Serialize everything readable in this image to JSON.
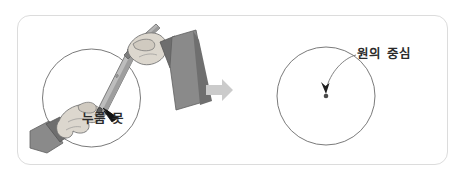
{
  "figure": {
    "panel": {
      "border_color": "#dcdcdc",
      "background_color": "#ffffff",
      "corner_radius": 13
    },
    "transition": {
      "icon": "right-arrow-icon",
      "color": "#c9c9c9",
      "direction": "right"
    }
  },
  "left_scene": {
    "name": "hands-drawing-circle",
    "circle": {
      "cx": 91.5,
      "cy": 98,
      "r": 49,
      "stroke_color": "#6b6b6b"
    },
    "label": {
      "text": "누름 못",
      "color": "#2b2b2b"
    },
    "pointer": {
      "icon": "arrow-pointer-icon",
      "color": "#1a1a1a",
      "points_to": "누름 못"
    },
    "objects": [
      {
        "name": "ruler-compass-bar",
        "fill": "#b3b3b3"
      },
      {
        "name": "pencil",
        "fill": "#a8a8a8"
      },
      {
        "name": "left-hand",
        "fill": "#d8d3cb"
      },
      {
        "name": "right-hand",
        "fill": "#d8d3cb"
      },
      {
        "name": "left-sleeve",
        "fill": "#7a7a7a"
      },
      {
        "name": "right-sleeve",
        "fill": "#7a7a7a"
      },
      {
        "name": "push-pin",
        "fill": "#5a5a5a"
      }
    ]
  },
  "right_scene": {
    "name": "finished-circle",
    "circle": {
      "cx": 326,
      "cy": 96,
      "r": 49,
      "stroke_color": "#6b6b6b"
    },
    "center_dot": {
      "name": "circle-center-dot",
      "cx": 326,
      "cy": 96,
      "r": 2.2,
      "color": "#4a4a4a"
    },
    "label": {
      "text": "원의 중심",
      "color": "#2b2b2b"
    },
    "leader": {
      "name": "leader-line",
      "color": "#6b6b6b",
      "arrowhead": "arrowhead-icon"
    }
  },
  "colors": {
    "frame_border": "#dcdcdc",
    "circle_stroke": "#6b6b6b",
    "text": "#2b2b2b",
    "arrow_fill": "#c9c9c9",
    "skin": "#d8d3cb",
    "sleeve": "#7a7a7a",
    "ruler": "#b3b3b3"
  }
}
